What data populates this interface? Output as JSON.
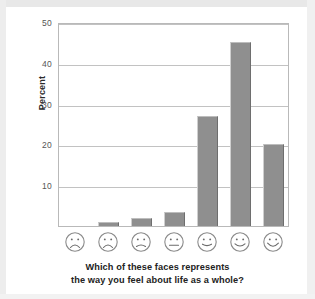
{
  "chart_data": {
    "type": "bar",
    "title": "",
    "caption_line1": "Which of these faces represents",
    "caption_line2": "the way you feel about life as a whole?",
    "xlabel": "",
    "ylabel": "Percent",
    "ylim": [
      0,
      50
    ],
    "yticks": [
      10,
      20,
      30,
      40,
      50
    ],
    "ytick_labels": [
      "10",
      "20",
      "30",
      "40",
      "50"
    ],
    "grid": "horizontal",
    "legend": "none",
    "categories": [
      "face-1-very-unhappy",
      "face-2-unhappy",
      "face-3-slightly-unhappy",
      "face-4-neutral",
      "face-5-slightly-happy",
      "face-6-happy",
      "face-7-very-happy"
    ],
    "category_glyphs": [
      "frown",
      "frown",
      "slight-frown",
      "neutral",
      "slight-smile",
      "smile",
      "big-smile"
    ],
    "values": [
      0,
      1,
      2,
      3.5,
      27,
      45,
      20
    ],
    "bar_color": "#8f8f8f",
    "bar_edge_light": "#cfcfcf",
    "bar_edge_dark": "#6e6e6e",
    "axis_color": "#b9b9b9",
    "grid_color": "#c2c2c2"
  }
}
